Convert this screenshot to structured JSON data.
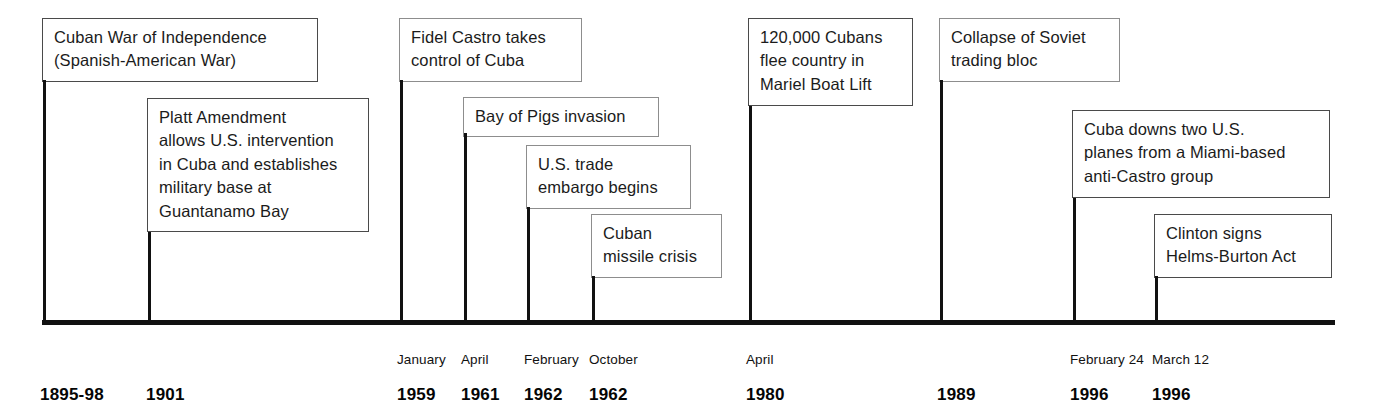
{
  "diagram": {
    "type": "historical-timeline",
    "axis": {
      "color": "#111111",
      "start_x": 42,
      "end_x": 1335,
      "baseline_y": 320
    }
  },
  "events": [
    {
      "id": "cuban-war-of-independence",
      "text": "Cuban War of Independence\n(Spanish-American War)",
      "month": "",
      "year": "1895-98",
      "tick_x": 43,
      "box": {
        "left": 42,
        "top": 18,
        "width": 276,
        "height": 62
      },
      "line": {
        "x": 43,
        "top": 80,
        "bottom": 320
      },
      "label_x": 40
    },
    {
      "id": "platt-amendment",
      "text": "Platt Amendment\nallows U.S. intervention\nin Cuba and establishes\nmilitary base at\nGuantanamo Bay",
      "month": "",
      "year": "1901",
      "tick_x": 148,
      "box": {
        "left": 147,
        "top": 98,
        "width": 222,
        "height": 134
      },
      "line": {
        "x": 148,
        "top": 232,
        "bottom": 320
      },
      "label_x": 146
    },
    {
      "id": "fidel-castro-takes-control",
      "text": "Fidel Castro takes\ncontrol of Cuba",
      "month": "January",
      "year": "1959",
      "tick_x": 400,
      "box": {
        "left": 399,
        "top": 18,
        "width": 183,
        "height": 62
      },
      "line": {
        "x": 400,
        "top": 80,
        "bottom": 320
      },
      "label_x": 397
    },
    {
      "id": "bay-of-pigs-invasion",
      "text": "Bay of Pigs invasion",
      "month": "April",
      "year": "1961",
      "tick_x": 464,
      "box": {
        "left": 463,
        "top": 97,
        "width": 196,
        "height": 36
      },
      "line": {
        "x": 464,
        "top": 133,
        "bottom": 320
      },
      "label_x": 461
    },
    {
      "id": "us-trade-embargo-begins",
      "text": "U.S. trade\nembargo begins",
      "month": "February",
      "year": "1962",
      "tick_x": 527,
      "box": {
        "left": 526,
        "top": 145,
        "width": 165,
        "height": 62
      },
      "line": {
        "x": 527,
        "top": 207,
        "bottom": 320
      },
      "label_x": 524
    },
    {
      "id": "cuban-missile-crisis",
      "text": "Cuban\nmissile crisis",
      "month": "October",
      "year": "1962",
      "tick_x": 592,
      "box": {
        "left": 591,
        "top": 214,
        "width": 131,
        "height": 62
      },
      "line": {
        "x": 592,
        "top": 276,
        "bottom": 320
      },
      "label_x": 589
    },
    {
      "id": "mariel-boat-lift",
      "text": "120,000 Cubans\nflee country in\nMariel Boat Lift",
      "month": "April",
      "year": "1980",
      "tick_x": 749,
      "box": {
        "left": 748,
        "top": 18,
        "width": 165,
        "height": 88
      },
      "line": {
        "x": 749,
        "top": 106,
        "bottom": 320
      },
      "label_x": 746
    },
    {
      "id": "collapse-of-soviet-trading-bloc",
      "text": "Collapse of Soviet\ntrading bloc",
      "month": "",
      "year": "1989",
      "tick_x": 940,
      "box": {
        "left": 939,
        "top": 18,
        "width": 181,
        "height": 62
      },
      "line": {
        "x": 940,
        "top": 80,
        "bottom": 320
      },
      "label_x": 937
    },
    {
      "id": "cuba-downs-two-us-planes",
      "text": "Cuba downs two U.S.\nplanes from a Miami-based\nanti-Castro group",
      "month": "February 24",
      "year": "1996",
      "tick_x": 1073,
      "box": {
        "left": 1072,
        "top": 110,
        "width": 258,
        "height": 88
      },
      "line": {
        "x": 1073,
        "top": 198,
        "bottom": 320
      },
      "label_x": 1070
    },
    {
      "id": "clinton-signs-helms-burton-act",
      "text": "Clinton signs\nHelms-Burton Act",
      "month": "March 12",
      "year": "1996",
      "tick_x": 1155,
      "box": {
        "left": 1154,
        "top": 214,
        "width": 178,
        "height": 62
      },
      "line": {
        "x": 1155,
        "top": 276,
        "bottom": 320
      },
      "label_x": 1152
    }
  ]
}
